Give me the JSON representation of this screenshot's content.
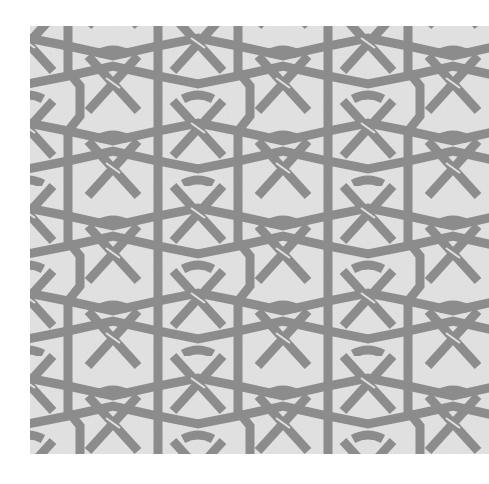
{
  "image": {
    "subject": "Interlaced geometric star pattern",
    "colors": {
      "background": "#e3e3e3",
      "strand": "#8e8e8e",
      "page": "#ffffff"
    }
  }
}
